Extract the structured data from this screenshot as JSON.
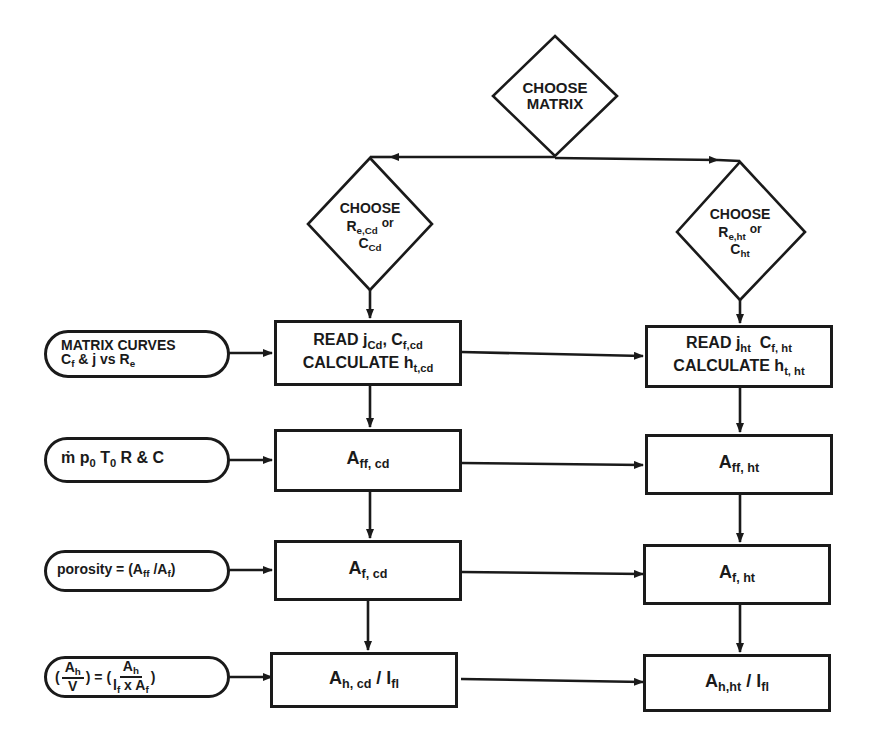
{
  "diagram": {
    "type": "flowchart",
    "decisions": {
      "choose_matrix": {
        "line1": "CHOOSE",
        "line2": "MATRIX"
      },
      "choose_cd": {
        "line1": "CHOOSE",
        "r_main": "R",
        "r_sub": "e,Cd",
        "or": "or",
        "c_main": "C",
        "c_sub": "Cd"
      },
      "choose_ht": {
        "line1": "CHOOSE",
        "r_main": "R",
        "r_sub": "e,ht",
        "or": "or",
        "c_main": "C",
        "c_sub": "ht"
      }
    },
    "inputs": [
      {
        "id": "matrix_curves",
        "line1": "MATRIX CURVES",
        "l2_c": "C",
        "l2_c_sub": "f",
        "l2_mid": " & j vs ",
        "l2_r": "R",
        "l2_r_sub": "e"
      },
      {
        "id": "flow_params",
        "m": "ṁ",
        "p": " p",
        "p_sub": "0",
        "t": " T",
        "t_sub": "0",
        "rest": " R & C"
      },
      {
        "id": "porosity",
        "lhs": "porosity = (A",
        "sub1": "ff",
        "mid": " /A",
        "sub2": "f",
        "close": ")"
      },
      {
        "id": "area_density",
        "lhs_open": "(",
        "lhs_num": "A",
        "lhs_num_sub": "h",
        "lhs_den": "V",
        "lhs_close": ")",
        "eq": " = (",
        "rhs_num": "A",
        "rhs_num_sub": "h",
        "rhs_den_a": "l",
        "rhs_den_a_sub": "f",
        "rhs_den_x": " x A",
        "rhs_den_b_sub": "f",
        "rhs_close": ")"
      }
    ],
    "cd_column": [
      {
        "id": "read_cd",
        "l1_read": "READ j",
        "l1_j_sub": "Cd",
        "l1_comma": ", C",
        "l1_c_sub": "f,cd",
        "l2_calc": "CALCULATE h",
        "l2_h_sub": "t,cd"
      },
      {
        "id": "aff_cd",
        "main": "A",
        "sub": "ff, cd"
      },
      {
        "id": "af_cd",
        "main": "A",
        "sub": "f, cd"
      },
      {
        "id": "ah_cd",
        "main": "A",
        "sub": "h, cd",
        "slash": " / l",
        "sub2": "fl"
      }
    ],
    "ht_column": [
      {
        "id": "read_ht",
        "l1_read": "READ j",
        "l1_j_sub": "ht",
        "l1_comma": "  C",
        "l1_c_sub": "f, ht",
        "l2_calc": "CALCULATE h",
        "l2_h_sub": "t, ht"
      },
      {
        "id": "aff_ht",
        "main": "A",
        "sub": "ff, ht"
      },
      {
        "id": "af_ht",
        "main": "A",
        "sub": "f, ht"
      },
      {
        "id": "ah_ht",
        "main": "A",
        "sub": "h,ht",
        "slash": " / l",
        "sub2": "fl"
      }
    ],
    "colors": {
      "ink": "#1a1a1a",
      "background": "#ffffff"
    }
  }
}
